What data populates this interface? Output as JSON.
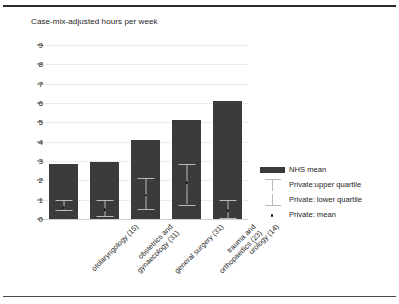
{
  "chart_data": {
    "type": "bar",
    "title": "Case-mix-adjusted hours per week",
    "xlabel": "",
    "ylabel": "",
    "ylim": [
      0,
      9
    ],
    "yticks": [
      0,
      1,
      2,
      3,
      4,
      5,
      6,
      7,
      8,
      9
    ],
    "grid": true,
    "legend_position": "right",
    "categories": [
      "otolaryngology (15)",
      "obstetrics and gynaecology (31)",
      "general surgery (31)",
      "trauma and orthopaedics (23)",
      "urology (14)"
    ],
    "category_lines": [
      [
        "otolaryngology (15)"
      ],
      [
        "obstetrics and",
        "gynaecology (31)"
      ],
      [
        "general surgery (31)"
      ],
      [
        "trauma and",
        "orthopaedics (23)"
      ],
      [
        "urology (14)"
      ]
    ],
    "series": [
      {
        "name": "NHS mean",
        "type": "bar",
        "values": [
          2.85,
          2.95,
          4.1,
          5.1,
          6.1
        ]
      },
      {
        "name": "Private: mean",
        "type": "point",
        "values": [
          0.65,
          0.55,
          1.3,
          1.95,
          0.5
        ]
      },
      {
        "name": "Private: upper quartile",
        "type": "errorbar-upper",
        "values": [
          1.0,
          1.0,
          2.1,
          2.85,
          1.0
        ]
      },
      {
        "name": "Private: lower quartile",
        "type": "errorbar-lower",
        "values": [
          0.45,
          0.15,
          0.5,
          0.75,
          0.05
        ]
      }
    ],
    "legend": [
      {
        "label": "NHS mean",
        "marker": "bar-swatch",
        "color": "#3b3b3b"
      },
      {
        "label": "Private:upper quartile",
        "marker": "errorbar-upper-icon",
        "color": "#b9b9b9"
      },
      {
        "label": "Private: lower quartile",
        "marker": "errorbar-lower-icon",
        "color": "#b9b9b9"
      },
      {
        "label": "Private: mean",
        "marker": "dot-icon",
        "color": "#111111"
      }
    ],
    "colors": {
      "bar": "#3b3b3b",
      "errorbar": "#b9b9b9",
      "mean_dot": "#111111",
      "grid": "#d9d9d9",
      "text": "#1d1d1b",
      "background": "#ffffff",
      "rule": "#2b2b2b"
    }
  }
}
